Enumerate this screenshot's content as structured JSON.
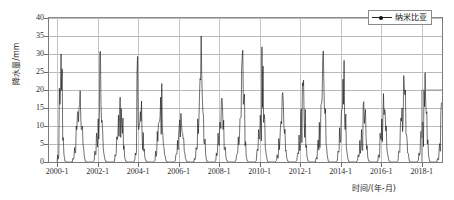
{
  "chart_data": {
    "type": "line",
    "title": "",
    "xlabel": "时间/(年-月)",
    "ylabel": "降水量/mm",
    "ylim": [
      0,
      40
    ],
    "yticks": [
      0,
      5,
      10,
      15,
      20,
      25,
      30,
      35,
      40
    ],
    "xticks": [
      "2000-1",
      "2002-1",
      "2004-1",
      "2006-1",
      "2008-1",
      "2010-1",
      "2012-1",
      "2014-1",
      "2016-1",
      "2018-1"
    ],
    "xtick_years": [
      2000,
      2002,
      2004,
      2006,
      2008,
      2010,
      2012,
      2014,
      2016,
      2018
    ],
    "xlim_years": [
      1999.6,
      2019.0
    ],
    "grid": "horizontal-and-vertical",
    "legend_position": "top-right",
    "series": [
      {
        "name": "纳米比亚",
        "color": "#111111",
        "marker": "dot",
        "units": "mm",
        "x_start": "2000-1",
        "x_end": "2018-12",
        "sampling": "monthly",
        "values": [
          2.0,
          20.5,
          30.0,
          6.0,
          0.5,
          0.0,
          0.0,
          0.0,
          0.0,
          1.0,
          4.0,
          10.0,
          14.0,
          16.0,
          9.0,
          5.0,
          0.5,
          0.0,
          0.0,
          0.0,
          0.0,
          0.5,
          3.0,
          8.0,
          12.0,
          30.5,
          11.0,
          4.0,
          0.5,
          0.0,
          0.0,
          0.0,
          0.0,
          0.5,
          2.0,
          7.0,
          13.0,
          18.0,
          10.0,
          3.5,
          0.5,
          0.0,
          0.0,
          0.0,
          0.0,
          0.5,
          2.5,
          25.0,
          9.0,
          14.0,
          8.0,
          3.0,
          0.5,
          0.0,
          0.0,
          0.0,
          0.0,
          0.5,
          3.0,
          8.5,
          11.0,
          18.0,
          9.5,
          4.0,
          0.5,
          0.0,
          0.0,
          0.0,
          0.0,
          0.5,
          2.0,
          6.0,
          10.0,
          13.5,
          8.0,
          3.0,
          0.5,
          0.0,
          0.0,
          0.0,
          0.0,
          1.0,
          4.0,
          12.0,
          18.0,
          35.0,
          14.0,
          5.0,
          0.5,
          0.0,
          0.0,
          0.0,
          0.0,
          0.5,
          2.5,
          8.0,
          11.0,
          17.0,
          9.0,
          3.5,
          0.5,
          0.0,
          0.0,
          0.0,
          0.0,
          0.5,
          2.0,
          7.0,
          12.0,
          26.0,
          16.0,
          4.5,
          0.5,
          0.0,
          0.0,
          0.0,
          0.0,
          0.5,
          3.0,
          9.0,
          13.0,
          32.0,
          11.0,
          4.0,
          0.5,
          0.0,
          0.0,
          0.0,
          0.0,
          0.5,
          2.0,
          6.5,
          10.0,
          18.5,
          10.0,
          3.0,
          0.5,
          0.0,
          0.0,
          0.0,
          0.0,
          0.5,
          2.0,
          7.5,
          14.0,
          22.0,
          12.0,
          4.0,
          0.5,
          0.0,
          0.0,
          0.0,
          0.0,
          1.0,
          5.0,
          11.0,
          16.0,
          28.0,
          15.0,
          5.0,
          0.5,
          0.0,
          0.0,
          0.0,
          0.0,
          0.5,
          3.0,
          9.5,
          13.0,
          23.0,
          11.0,
          4.0,
          0.5,
          0.0,
          0.0,
          0.0,
          0.0,
          0.5,
          2.0,
          6.0,
          9.0,
          16.0,
          13.0,
          3.5,
          0.5,
          0.0,
          0.0,
          0.0,
          0.0,
          0.5,
          2.0,
          8.0,
          12.0,
          19.0,
          14.0,
          4.0,
          0.5,
          0.0,
          0.0,
          0.0,
          0.0,
          0.5,
          3.0,
          10.0,
          15.0,
          24.0,
          20.0,
          6.0,
          0.5,
          0.0,
          0.0,
          0.0,
          0.0,
          0.5,
          2.5,
          8.0,
          11.0,
          20.0,
          17.0,
          5.0,
          0.5,
          0.0,
          0.0,
          0.0,
          0.0,
          1.0,
          4.0,
          14.0
        ],
        "max_value": 35.0,
        "min_value": 0.0
      }
    ],
    "legend_entries": [
      "纳米比亚"
    ],
    "annotations": [
      {
        "type": "vertical-line",
        "x": "2018-1",
        "from": 0,
        "to": 20
      }
    ]
  },
  "axes": {
    "y_title": "降水量/mm",
    "x_title": "时间/(年-月)"
  },
  "legend": {
    "label": "纳米比亚"
  }
}
